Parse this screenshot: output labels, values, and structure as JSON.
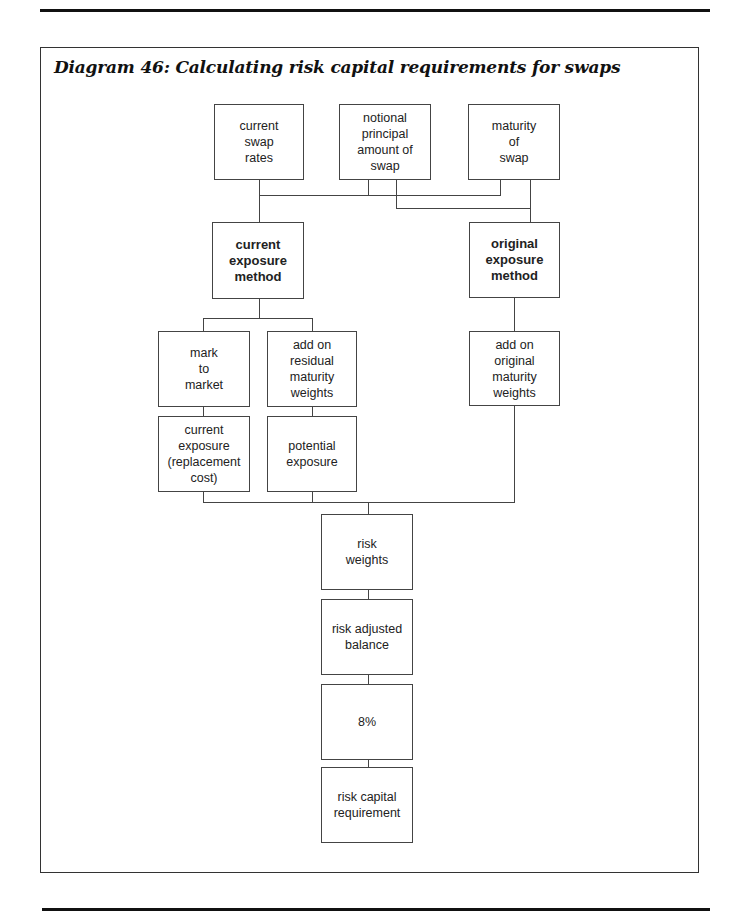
{
  "title": "Diagram 46: Calculating risk capital requirements for swaps",
  "nodes": {
    "current_swap_rates": "current\nswap\nrates",
    "notional_principal": "notional\nprincipal\namount of\nswap",
    "maturity_of_swap": "maturity\nof\nswap",
    "current_exposure_method": "current\nexposure\nmethod",
    "original_exposure_method": "original\nexposure\nmethod",
    "mark_to_market": "mark\nto\nmarket",
    "add_on_residual": "add on\nresidual\nmaturity\nweights",
    "add_on_original": "add on\noriginal\nmaturity\nweights",
    "current_exposure": "current\nexposure\n(replacement\ncost)",
    "potential_exposure": "potential\nexposure",
    "risk_weights": "risk\nweights",
    "risk_adjusted_balance": "risk adjusted\nbalance",
    "eight_percent": "8%",
    "risk_capital_requirement": "risk capital\nrequirement"
  }
}
